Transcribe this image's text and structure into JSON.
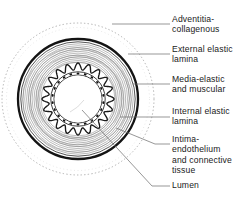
{
  "figure": {
    "background_color": "#ffffff",
    "ink_color": "#1a1a1a",
    "leader_color": "#6a6a6a",
    "structure": {
      "outer_boundary": "dashed-circle",
      "layers": [
        "adventitia-collagenous",
        "external-elastic-lamina",
        "media-elastic-and-muscular",
        "internal-elastic-lamina",
        "intima-endothelium",
        "lumen"
      ],
      "lamina_undulations": 20,
      "endothelial_nuclei": 22
    },
    "labels": [
      {
        "id": "adventitia",
        "lines": [
          "Adventitia-",
          "collagenous"
        ],
        "text_x": 172,
        "text_y": 22,
        "leader": "M 112 24 L 170 24"
      },
      {
        "id": "external-elastic-lamina",
        "lines": [
          "External elastic",
          "lamina"
        ],
        "text_x": 172,
        "text_y": 52,
        "leader": "M 128 54 L 170 54"
      },
      {
        "id": "media",
        "lines": [
          "Media-elastic",
          "and  muscular"
        ],
        "text_x": 172,
        "text_y": 82,
        "leader": "M 133 84 L 170 84"
      },
      {
        "id": "internal-elastic-lamina",
        "lines": [
          "Internal elastic",
          "lamina"
        ],
        "text_x": 172,
        "text_y": 114,
        "leader": "M 120 117 L 170 117"
      },
      {
        "id": "intima",
        "lines": [
          "Intima-",
          "endothelium",
          "and  connective",
          "tissue"
        ],
        "text_x": 172,
        "text_y": 142,
        "leader": "M 116 128 L 155 144 L 170 144"
      },
      {
        "id": "lumen",
        "lines": [
          "Lumen"
        ],
        "text_x": 172,
        "text_y": 188,
        "leader": "M 82 110 L 152 186 L 170 186"
      }
    ]
  }
}
